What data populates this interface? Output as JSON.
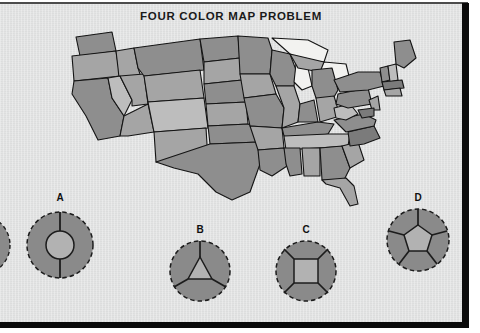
{
  "page": {
    "title": "FOUR COLOR MAP PROBLEM",
    "background_color": "#e2e3e3",
    "border_color": "#0a0a0a",
    "title_color": "#1a1a1a"
  },
  "map": {
    "name": "united-states-map",
    "description": "Grayscale map of the contiguous United States with states shaded in four gray tones",
    "lake_color": "#f2f2f0",
    "outline_color": "#141414",
    "shades": {
      "dark": "#7b7b7b",
      "medium": "#8e8e8e",
      "light": "#a5a5a5",
      "lightest": "#bdbdbd"
    }
  },
  "diagrams": {
    "edge_partial": {
      "label": "",
      "name": "diagram-partial-left",
      "regions": 2,
      "inner_shape": "circle"
    },
    "items": [
      {
        "label": "A",
        "name": "diagram-a",
        "inner_shape": "circle",
        "outer_regions": 2,
        "total_regions": 3
      },
      {
        "label": "B",
        "name": "diagram-b",
        "inner_shape": "triangle",
        "outer_regions": 3,
        "total_regions": 4
      },
      {
        "label": "C",
        "name": "diagram-c",
        "inner_shape": "square",
        "outer_regions": 4,
        "total_regions": 5
      },
      {
        "label": "D",
        "name": "diagram-d",
        "inner_shape": "pentagon",
        "outer_regions": 5,
        "total_regions": 6
      }
    ],
    "colors": {
      "fill_dark": "#8a8a8a",
      "fill_light": "#b2b2b2",
      "stroke": "#1c1c1c"
    }
  }
}
